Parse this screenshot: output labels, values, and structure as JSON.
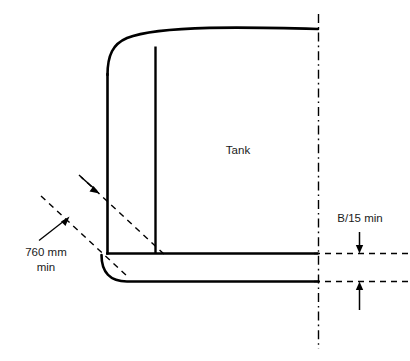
{
  "diagram": {
    "background_color": "#ffffff",
    "line_color": "#000000",
    "labels": {
      "tank": "Tank",
      "clearance_760_line1": "760 mm",
      "clearance_760_line2": "min",
      "clearance_b15": "B/15 min"
    },
    "annotations": [
      {
        "name": "diagonal-clearance",
        "text": "760 mm min",
        "type": "dimension",
        "orientation": "diagonal",
        "position": "lower-left"
      },
      {
        "name": "bottom-clearance",
        "text": "B/15 min",
        "type": "dimension",
        "orientation": "vertical",
        "position": "lower-right"
      }
    ],
    "elements": {
      "tank_outline": "rounded-corner tank section with curved deck",
      "centerline": "vertical dash-dot centreline at ship side",
      "inner_bulkhead": "vertical internal boundary line",
      "inner_bottom": "horizontal tank bottom line",
      "outer_bottom": "horizontal hull bottom line"
    }
  }
}
